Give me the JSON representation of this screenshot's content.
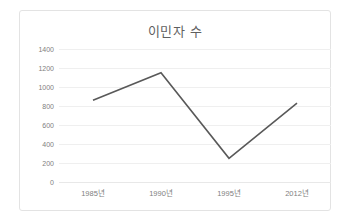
{
  "chart": {
    "title": "이민자 수",
    "title_color": "#5f5f5f",
    "border_color": "#e3e3e3",
    "background": "#ffffff",
    "gridline_color": "#efefef",
    "axis_label_color": "#808080"
  },
  "chart_data": {
    "type": "line",
    "title": "이민자 수",
    "xlabel": "",
    "ylabel": "",
    "categories": [
      "1985년",
      "1990년",
      "1995년",
      "2012년"
    ],
    "series": [
      {
        "name": "이민자 수",
        "color": "#595959",
        "values": [
          860,
          1150,
          250,
          830
        ]
      }
    ],
    "ylim": [
      0,
      1400
    ],
    "ytick_values": [
      0,
      200,
      400,
      600,
      800,
      1000,
      1200,
      1400
    ],
    "ytick_labels": [
      "0",
      "200",
      "400",
      "600",
      "800",
      "1000",
      "1200",
      "1400"
    ],
    "grid": true,
    "grid_axis": "y",
    "legend": false,
    "markers": false,
    "line_width": 1.6
  }
}
